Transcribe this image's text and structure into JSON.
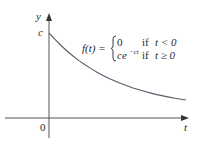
{
  "figure": {
    "y_axis_label": "y",
    "x_axis_label": "t",
    "origin_label": "0",
    "y_intercept_label": "c",
    "formula": {
      "lhs": "f(t) =",
      "cases": [
        {
          "value": "0",
          "condition_prefix": "if",
          "condition": "t < 0"
        },
        {
          "value_base": "ce",
          "value_exponent": "−ct",
          "condition_prefix": "if",
          "condition": "t ≥ 0"
        }
      ]
    },
    "colors": {
      "axis": "#555555",
      "curve": "#5a5a6a",
      "text": "#2b2b2b",
      "background": "#ffffff"
    }
  }
}
